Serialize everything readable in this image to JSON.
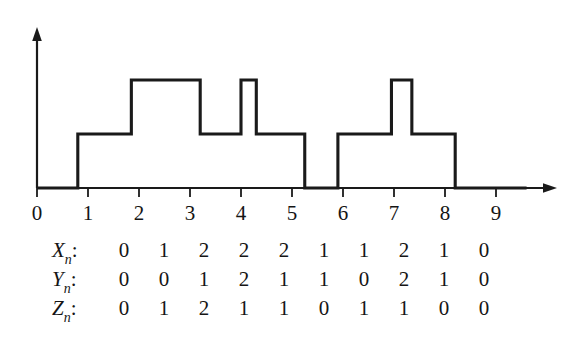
{
  "figure": {
    "background_color": "#ffffff",
    "stroke_color": "#1a1a1a"
  },
  "chart_data": {
    "type": "line",
    "title": "",
    "subtitle": "",
    "xlabel": "",
    "ylabel": "",
    "style": "step-post",
    "grid": false,
    "legend": null,
    "xlim": [
      0,
      9.6
    ],
    "ylim": [
      0,
      2.6
    ],
    "xticks": [
      0,
      1,
      2,
      3,
      4,
      5,
      6,
      7,
      8,
      9
    ],
    "xtick_labels": [
      "0",
      "1",
      "2",
      "3",
      "4",
      "5",
      "6",
      "7",
      "8",
      "9"
    ],
    "yticks": [],
    "ytick_labels": [],
    "x_axis_arrow": true,
    "y_axis_arrow": true,
    "series": [
      {
        "name": "step-function",
        "step_breakpoints": [
          0,
          0.8,
          1.85,
          3.2,
          4.0,
          4.3,
          5.25,
          5.9,
          6.95,
          7.35,
          8.2,
          9.6
        ],
        "step_levels": [
          0,
          1,
          2,
          1,
          2,
          1,
          0,
          1,
          2,
          1,
          0
        ]
      }
    ]
  },
  "table": {
    "rows": [
      {
        "symbol": "X",
        "subscript": "n",
        "colon": ":",
        "values": [
          "0",
          "1",
          "2",
          "2",
          "2",
          "1",
          "1",
          "2",
          "1",
          "0"
        ]
      },
      {
        "symbol": "Y",
        "subscript": "n",
        "colon": ":",
        "values": [
          "0",
          "0",
          "1",
          "2",
          "1",
          "1",
          "0",
          "2",
          "1",
          "0"
        ]
      },
      {
        "symbol": "Z",
        "subscript": "n",
        "colon": ":",
        "values": [
          "0",
          "1",
          "2",
          "1",
          "1",
          "0",
          "1",
          "1",
          "0",
          "0"
        ]
      }
    ]
  }
}
